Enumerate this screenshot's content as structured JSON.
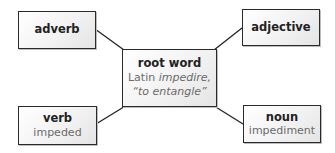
{
  "diagram": {
    "type": "word-web",
    "center": {
      "title": "root word",
      "line1_prefix": "Latin ",
      "line1_italic": "impedire,",
      "line2": "“to entangle”"
    },
    "nodes": [
      {
        "id": "adverb",
        "title": "adverb",
        "text": ""
      },
      {
        "id": "adjective",
        "title": "adjective",
        "text": ""
      },
      {
        "id": "verb",
        "title": "verb",
        "text": "impeded"
      },
      {
        "id": "noun",
        "title": "noun",
        "text": "impediment"
      }
    ],
    "colors": {
      "border": "#2a2a2a",
      "title": "#222222",
      "subtext": "#6a6a6a",
      "line": "#222222"
    }
  }
}
